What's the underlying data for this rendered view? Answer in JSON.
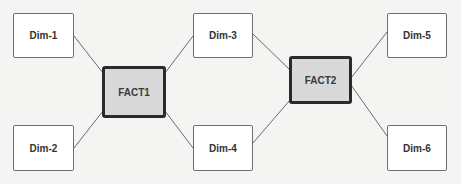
{
  "diagram": {
    "type": "star-schema",
    "colors": {
      "background": "#f4f4f2",
      "dimension_fill": "#ffffff",
      "dimension_border": "#6e6e6e",
      "fact_fill": "#d9d9d9",
      "fact_border": "#2a2a2a",
      "connector": "#6a6a6a"
    },
    "facts": [
      {
        "id": "fact1",
        "label": "FACT1"
      },
      {
        "id": "fact2",
        "label": "FACT2"
      }
    ],
    "dimensions": [
      {
        "id": "dim1",
        "label": "Dim-1"
      },
      {
        "id": "dim2",
        "label": "Dim-2"
      },
      {
        "id": "dim3",
        "label": "Dim-3"
      },
      {
        "id": "dim4",
        "label": "Dim-4"
      },
      {
        "id": "dim5",
        "label": "Dim-5"
      },
      {
        "id": "dim6",
        "label": "Dim-6"
      }
    ],
    "edges": [
      {
        "from": "Dim-1",
        "to": "FACT1"
      },
      {
        "from": "Dim-2",
        "to": "FACT1"
      },
      {
        "from": "Dim-3",
        "to": "FACT1"
      },
      {
        "from": "Dim-4",
        "to": "FACT1"
      },
      {
        "from": "Dim-3",
        "to": "FACT2"
      },
      {
        "from": "Dim-4",
        "to": "FACT2"
      },
      {
        "from": "Dim-5",
        "to": "FACT2"
      },
      {
        "from": "Dim-6",
        "to": "FACT2"
      }
    ]
  }
}
